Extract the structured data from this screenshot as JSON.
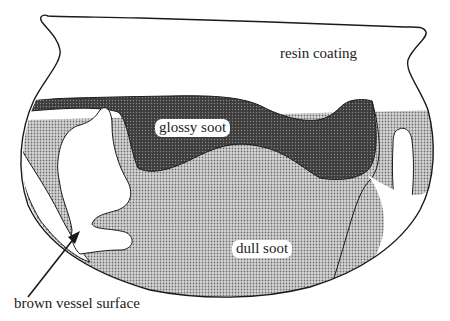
{
  "diagram": {
    "type": "vessel-residue-cross-section",
    "labels": {
      "resin": "resin coating",
      "glossy": "glossy soot",
      "dull": "dull soot",
      "surface": "brown vessel surface"
    },
    "legend_fills": {
      "resin": "#ffffff",
      "glossy": "#4a4a4a",
      "dull": "#b8b8b8",
      "surface": "#ffffff"
    },
    "outline_color": "#1a1a1a"
  }
}
